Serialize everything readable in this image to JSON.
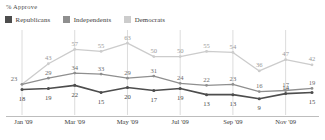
{
  "header": {
    "title": "% Approve"
  },
  "legend": {
    "items": [
      {
        "label": "Republicans",
        "color": "#4d4d4d"
      },
      {
        "label": "Independents",
        "color": "#8f8f8f"
      },
      {
        "label": "Democrats",
        "color": "#cccccc"
      }
    ]
  },
  "axis": {
    "x_ticks": [
      "Jan '09",
      "Mar '09",
      "May '09",
      "Jul '09",
      "Sep '09",
      "Nov '09"
    ]
  },
  "chart_data": {
    "type": "line",
    "title": "% Approve",
    "xlabel": "",
    "ylabel": "% Approve",
    "ylim": [
      0,
      70
    ],
    "grid": "vertical",
    "legend_position": "top-left",
    "categories": [
      "Jan '09",
      "Feb '09",
      "Mar '09",
      "Apr '09",
      "May '09",
      "Jun '09",
      "Jul '09",
      "Aug '09",
      "Sep '09",
      "Oct '09",
      "Nov '09",
      "Dec '09"
    ],
    "tick_categories": [
      "Jan '09",
      "Mar '09",
      "May '09",
      "Jul '09",
      "Sep '09",
      "Nov '09"
    ],
    "series": [
      {
        "name": "Republicans",
        "color": "#4d4d4d",
        "values": [
          18,
          19,
          22,
          15,
          20,
          17,
          19,
          13,
          13,
          9,
          14,
          15
        ],
        "labels": [
          "18",
          "19",
          "22",
          "15",
          "20",
          "17",
          "19",
          "13",
          "13",
          "9",
          "14",
          "15"
        ]
      },
      {
        "name": "Independents",
        "color": "#8f8f8f",
        "values": [
          23,
          29,
          34,
          33,
          29,
          31,
          24,
          22,
          23,
          16,
          17,
          19
        ],
        "labels": [
          "23",
          "29",
          "34",
          "33",
          "29",
          "31",
          "24",
          "22",
          "23",
          "16",
          "17",
          "19"
        ]
      },
      {
        "name": "Democrats",
        "color": "#cccccc",
        "values": [
          23,
          43,
          57,
          55,
          63,
          50,
          50,
          55,
          54,
          36,
          47,
          42
        ],
        "labels": [
          "23",
          "43",
          "57",
          "55",
          "63",
          "50",
          "50",
          "55",
          "54",
          "36",
          "47",
          "42"
        ]
      }
    ]
  }
}
